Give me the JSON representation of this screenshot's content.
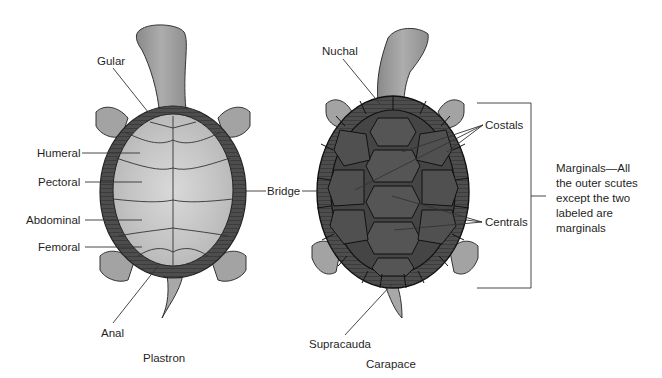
{
  "figure": {
    "title_left": "Plastron",
    "title_right": "Carapace",
    "colors": {
      "background": "#ffffff",
      "text": "#1f1f1f",
      "leader_line": "#333333",
      "plastron_fill": "#cfcfcf",
      "plastron_rim": "#5a5a5a",
      "carapace_fill": "#4a4a4a",
      "carapace_scute_line": "#1e1e1e",
      "skin": "#9a9a9a"
    }
  },
  "plastron": {
    "labels": [
      {
        "id": "gular",
        "text": "Gular"
      },
      {
        "id": "humeral",
        "text": "Humeral"
      },
      {
        "id": "pectoral",
        "text": "Pectoral"
      },
      {
        "id": "abdominal",
        "text": "Abdominal"
      },
      {
        "id": "femoral",
        "text": "Femoral"
      },
      {
        "id": "anal",
        "text": "Anal"
      },
      {
        "id": "bridge",
        "text": "Bridge"
      }
    ]
  },
  "carapace": {
    "labels": [
      {
        "id": "nuchal",
        "text": "Nuchal"
      },
      {
        "id": "costals",
        "text": "Costals"
      },
      {
        "id": "centrals",
        "text": "Centrals"
      },
      {
        "id": "supracauda",
        "text": "Supracauda"
      }
    ],
    "marginals_note": "Marginals—All\nthe outer scutes\nexcept the two\nlabeled are\nmarginals"
  }
}
